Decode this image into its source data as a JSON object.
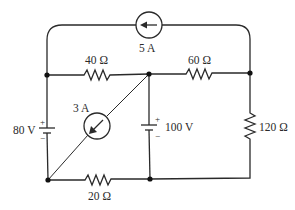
{
  "diagram": {
    "type": "electrical-circuit",
    "components": {
      "current_source_top": {
        "label": "5 A",
        "direction": "left"
      },
      "current_source_diag": {
        "label": "3 A",
        "direction": "down-left"
      },
      "resistor_top_left": {
        "label": "40 Ω"
      },
      "resistor_top_right": {
        "label": "60 Ω"
      },
      "resistor_right": {
        "label": "120 Ω"
      },
      "resistor_bottom": {
        "label": "20 Ω"
      },
      "voltage_source_left": {
        "label": "80 V",
        "plus": "+",
        "minus": "−"
      },
      "voltage_source_mid": {
        "label": "100 V",
        "plus": "+",
        "minus": "−"
      }
    },
    "colors": {
      "line": "#2a2a2a",
      "background": "#ffffff"
    }
  }
}
